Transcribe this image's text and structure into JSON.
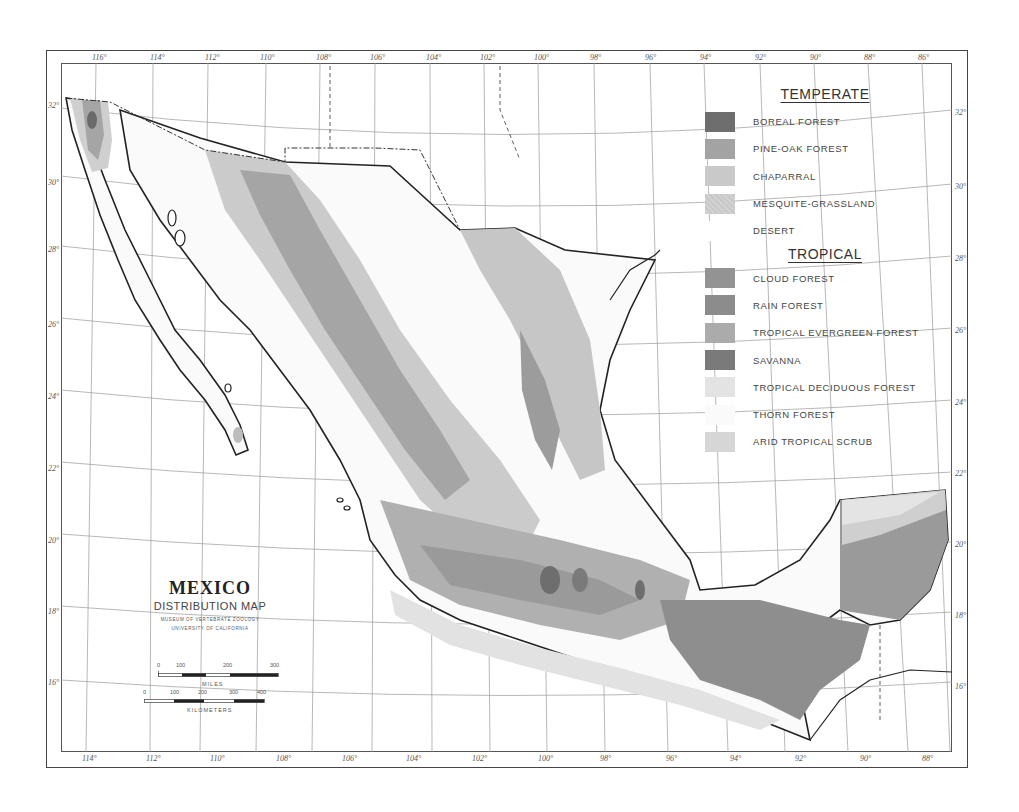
{
  "title": {
    "main": "MEXICO",
    "subtitle": "DISTRIBUTION MAP",
    "institution": "MUSEUM OF VERTEBRATE ZOOLOGY",
    "university": "UNIVERSITY OF CALIFORNIA"
  },
  "legend": {
    "temperate": {
      "heading": "TEMPERATE",
      "items": [
        {
          "label": "BOREAL FOREST",
          "color": "#6e6e6e"
        },
        {
          "label": "PINE-OAK FOREST",
          "color": "#a3a3a3"
        },
        {
          "label": "CHAPARRAL",
          "color": "#c9c9c9"
        },
        {
          "label": "MESQUITE-GRASSLAND",
          "color": "#cdcdcd"
        },
        {
          "label": "DESERT",
          "color": "#ffffff"
        }
      ]
    },
    "tropical": {
      "heading": "TROPICAL",
      "items": [
        {
          "label": "CLOUD FOREST",
          "color": "#939393"
        },
        {
          "label": "RAIN FOREST",
          "color": "#8c8c8c"
        },
        {
          "label": "TROPICAL EVERGREEN FOREST",
          "color": "#ababab"
        },
        {
          "label": "SAVANNA",
          "color": "#7a7a7a"
        },
        {
          "label": "TROPICAL DECIDUOUS FOREST",
          "color": "#e3e3e3"
        },
        {
          "label": "THORN FOREST",
          "color": "#fafafa"
        },
        {
          "label": "ARID TROPICAL SCRUB",
          "color": "#d6d6d6"
        }
      ]
    }
  },
  "scale": {
    "miles_label": "MILES",
    "miles_ticks": [
      "0",
      "100",
      "200",
      "300"
    ],
    "km_label": "KILOMETERS",
    "km_ticks": [
      "0",
      "100",
      "200",
      "300",
      "400"
    ]
  },
  "graticule": {
    "top_longitudes": [
      "116°",
      "114°",
      "112°",
      "110°",
      "108°",
      "106°",
      "104°",
      "102°",
      "100°",
      "98°",
      "96°",
      "94°",
      "92°",
      "90°",
      "88°",
      "86°"
    ],
    "bottom_longitudes": [
      "114°",
      "112°",
      "110°",
      "108°",
      "106°",
      "104°",
      "102°",
      "100°",
      "98°",
      "96°",
      "94°",
      "92°",
      "90°",
      "88°"
    ],
    "left_latitudes": [
      "32°",
      "30°",
      "28°",
      "26°",
      "24°",
      "22°",
      "20°",
      "18°",
      "16°"
    ],
    "right_latitudes": [
      "32°",
      "30°",
      "28°",
      "26°",
      "24°",
      "22°",
      "20°",
      "18°",
      "16°"
    ]
  }
}
